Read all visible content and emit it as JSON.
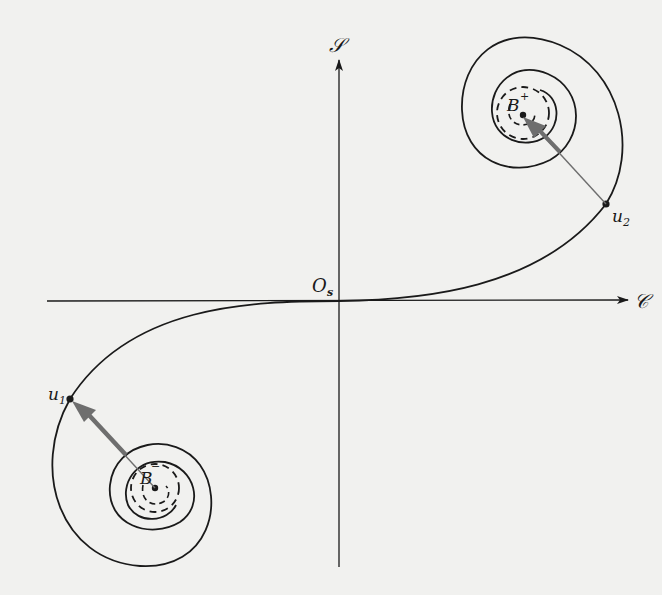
{
  "figure": {
    "background": "#f1f1ef",
    "ink_color": "#1a1a1a",
    "arrow_color": "#6e6e6e"
  },
  "axes": {
    "vertical_label": "𝒮",
    "horizontal_label": "𝒞",
    "origin_label": "O",
    "origin_subscript": "s"
  },
  "points": {
    "b_plus": {
      "label": "B",
      "superscript": "+"
    },
    "b_minus": {
      "label": "B",
      "superscript": "−"
    },
    "u1": {
      "label": "u",
      "subscript": "1"
    },
    "u2": {
      "label": "u",
      "subscript": "2"
    }
  }
}
